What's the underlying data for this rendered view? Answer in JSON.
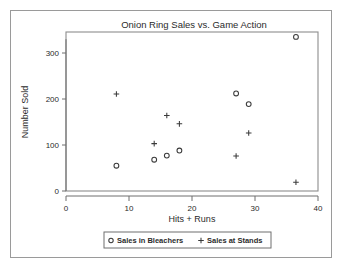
{
  "chart_data": {
    "type": "scatter",
    "title": "Onion Ring Sales vs. Game Action",
    "xlabel": "Hits + Runs",
    "ylabel": "Number Sold",
    "xlim": [
      0,
      40
    ],
    "ylim": [
      0,
      350
    ],
    "xticks": [
      "0",
      "10",
      "20",
      "30",
      "40"
    ],
    "xtick_values": [
      0,
      10,
      20,
      30,
      40
    ],
    "yticks": [
      "0",
      "100",
      "200",
      "300"
    ],
    "ytick_values": [
      0,
      100,
      200,
      300
    ],
    "grid": false,
    "legend_position": "bottom",
    "series": [
      {
        "name": "Sales in Bleachers",
        "marker": "circle",
        "color": "#3a3a3a",
        "points": [
          {
            "x": 8,
            "y": 55
          },
          {
            "x": 14,
            "y": 68
          },
          {
            "x": 16,
            "y": 77
          },
          {
            "x": 18,
            "y": 88
          },
          {
            "x": 27,
            "y": 212
          },
          {
            "x": 29,
            "y": 189
          },
          {
            "x": 36.5,
            "y": 335
          }
        ]
      },
      {
        "name": "Sales at Stands",
        "marker": "plus",
        "color": "#3a3a3a",
        "points": [
          {
            "x": 8,
            "y": 211
          },
          {
            "x": 14,
            "y": 103
          },
          {
            "x": 16,
            "y": 164
          },
          {
            "x": 18,
            "y": 146
          },
          {
            "x": 27,
            "y": 76
          },
          {
            "x": 29,
            "y": 126
          },
          {
            "x": 36.5,
            "y": 19
          }
        ]
      }
    ]
  },
  "legend": {
    "items": [
      {
        "symbol": "o",
        "label": "Sales in Bleachers"
      },
      {
        "symbol": "+",
        "label": "Sales at Stands"
      }
    ]
  }
}
